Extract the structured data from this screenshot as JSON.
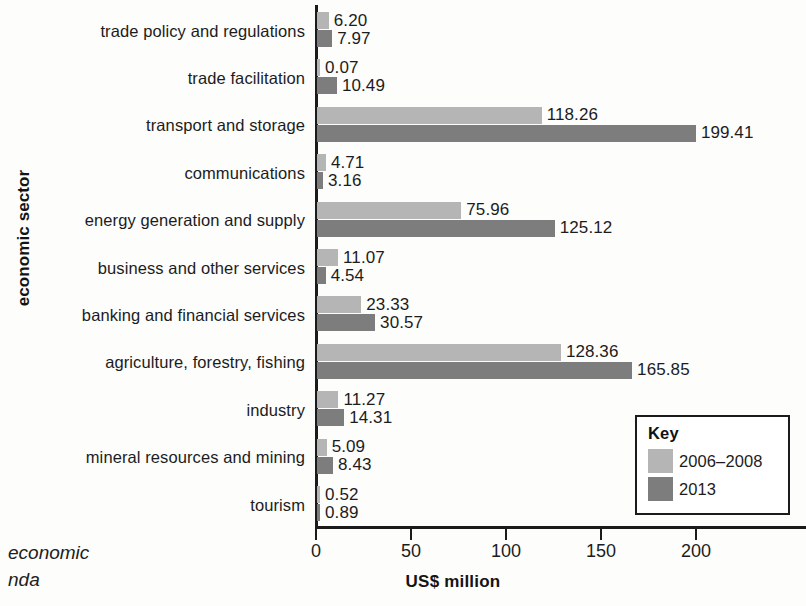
{
  "chart_data": {
    "type": "bar",
    "orientation": "horizontal",
    "title": "",
    "xlabel": "US$ million",
    "ylabel": "economic sector",
    "xlim": [
      0,
      220
    ],
    "xticks": [
      0,
      50,
      100,
      150,
      200
    ],
    "xtick_labels": [
      "0",
      "50",
      "100",
      "150",
      "200"
    ],
    "grid": false,
    "legend_position": "bottom-right",
    "legend_title": "Key",
    "categories": [
      "trade policy and regulations",
      "trade facilitation",
      "transport and storage",
      "communications",
      "energy generation and supply",
      "business and other services",
      "banking and financial services",
      "agriculture, forestry, fishing",
      "industry",
      "mineral resources and mining",
      "tourism"
    ],
    "series": [
      {
        "name": "2006–2008",
        "color": "#b5b5b5",
        "values": [
          6.2,
          0.07,
          118.26,
          4.71,
          75.96,
          11.07,
          23.33,
          128.36,
          11.27,
          5.09,
          0.52
        ],
        "labels": [
          "6.20",
          "0.07",
          "118.26",
          "4.71",
          "75.96",
          "11.07",
          "23.33",
          "128.36",
          "11.27",
          "5.09",
          "0.52"
        ]
      },
      {
        "name": "2013",
        "color": "#7d7d7d",
        "values": [
          7.97,
          10.49,
          199.41,
          3.16,
          125.12,
          4.54,
          30.57,
          165.85,
          14.31,
          8.43,
          0.89
        ],
        "labels": [
          "7.97",
          "10.49",
          "199.41",
          "3.16",
          "125.12",
          "4.54",
          "30.57",
          "165.85",
          "14.31",
          "8.43",
          "0.89"
        ]
      }
    ]
  },
  "caption": {
    "line1": "economic",
    "line2": "nda"
  }
}
